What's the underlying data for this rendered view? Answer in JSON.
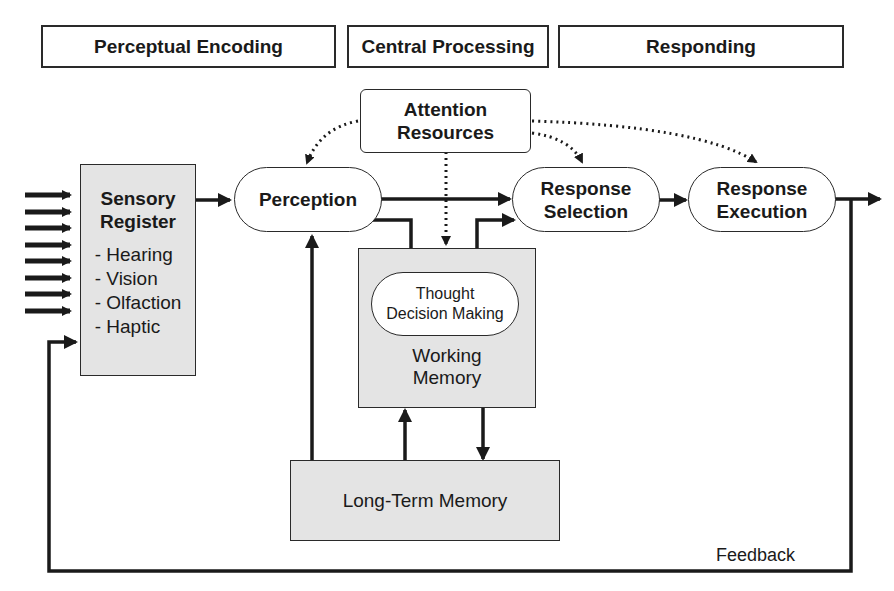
{
  "stages": [
    {
      "label": "Perceptual Encoding"
    },
    {
      "label": "Central Processing"
    },
    {
      "label": "Responding"
    }
  ],
  "nodes": {
    "attention": {
      "line1": "Attention",
      "line2": "Resources"
    },
    "sensory_register": {
      "line1": "Sensory",
      "line2": "Register",
      "senses": [
        "- Hearing",
        "- Vision",
        "- Olfaction",
        "- Haptic"
      ]
    },
    "perception": {
      "label": "Perception"
    },
    "response_selection": {
      "line1": "Response",
      "line2": "Selection"
    },
    "response_execution": {
      "line1": "Response",
      "line2": "Execution"
    },
    "thought": {
      "line1": "Thought",
      "line2": "Decision Making"
    },
    "working_memory": {
      "line1": "Working",
      "line2": "Memory"
    },
    "long_term_memory": {
      "label": "Long-Term Memory"
    }
  },
  "feedback_label": "Feedback",
  "colors": {
    "stroke": "#1a1a1a",
    "memory_fill": "#e4e4e4",
    "background": "#ffffff"
  }
}
